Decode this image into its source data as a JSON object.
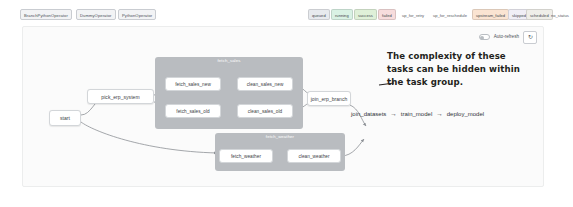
{
  "legend": {
    "operators": [
      {
        "label": "BranchPythonOperator"
      },
      {
        "label": "DummyOperator"
      },
      {
        "label": "PythonOperator"
      }
    ],
    "states": [
      {
        "label": "queued",
        "color": "#e7eaee",
        "boxed": true
      },
      {
        "label": "running",
        "color": "#d9f2e4",
        "boxed": true
      },
      {
        "label": "success",
        "color": "#dff0d8",
        "boxed": true
      },
      {
        "label": "failed",
        "color": "#f7dcdc",
        "boxed": true
      },
      {
        "label": "up_for_retry",
        "color": "#fbf3cd",
        "boxed": false
      },
      {
        "label": "up_for_reschedule",
        "color": "#e4f1f6",
        "boxed": false
      },
      {
        "label": "upstream_failed",
        "color": "#fae4d2",
        "boxed": false
      },
      {
        "label": "skipped",
        "color": "#f0eef6",
        "boxed": false
      },
      {
        "label": "scheduled",
        "color": "#efeee9",
        "boxed": false
      },
      {
        "label": "no_status",
        "color": "#ffffff",
        "boxed": false
      }
    ]
  },
  "toolbar": {
    "auto_refresh_label": "Auto-refresh",
    "auto_refresh_on": false,
    "refresh_icon": "refresh-icon",
    "refresh_glyph": "↻"
  },
  "graph": {
    "nodes": {
      "start": "start",
      "pick_erp_system": "pick_erp_system",
      "fetch_sales_new": "fetch_sales_new",
      "fetch_sales_old": "fetch_sales_old",
      "clean_sales_new": "clean_sales_new",
      "clean_sales_old": "clean_sales_old",
      "join_erp_branch": "join_erp_branch",
      "fetch_weather": "fetch_weather",
      "clean_weather": "clean_weather"
    },
    "groups": {
      "fetch_sales": "fetch_sales",
      "fetch_weather": "fetch_weather"
    },
    "downstream_chain": {
      "join_datasets": "join_datasets",
      "arrow1": "→",
      "train_model": "train_model",
      "arrow2": "→",
      "deploy_model": "deploy_model"
    }
  },
  "annotation": {
    "line1": "The complexity of these",
    "line2": "tasks can be hidden within",
    "line3": "the task group."
  },
  "colors": {
    "group_fill": "#b9bcc0",
    "node_fill": "#ffffff",
    "node_border": "#d3d6d9",
    "edge": "#8d9196",
    "annotation_text": "#231f20",
    "panel_bg": "#fbfbfb"
  }
}
